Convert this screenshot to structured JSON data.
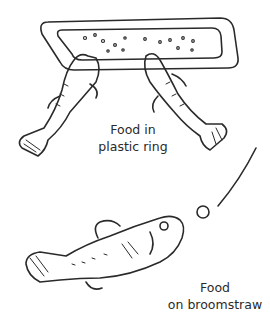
{
  "illustration": {
    "top_caption": {
      "line1": "Food in",
      "line2": "plastic ring"
    },
    "bottom_caption": {
      "line1": "Food",
      "line2": "on broomstraw"
    },
    "colors": {
      "ink": "#2a2a2a",
      "background": "#ffffff"
    }
  }
}
